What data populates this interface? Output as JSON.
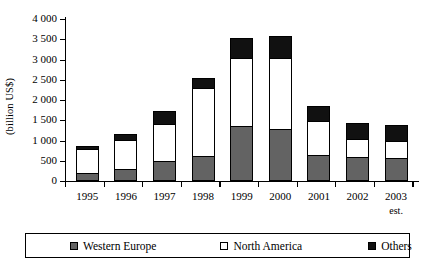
{
  "chart_data": {
    "type": "bar",
    "stacked": true,
    "title": "",
    "xlabel": "",
    "ylabel": "(billion US$)",
    "ylim": [
      0,
      4000
    ],
    "ytick_labels": [
      "4 000",
      "3 500",
      "3 000",
      "2 500",
      "2 000",
      "1 500",
      "1 000",
      "500",
      "0"
    ],
    "ytick_values": [
      4000,
      3500,
      3000,
      2500,
      2000,
      1500,
      1000,
      500,
      0
    ],
    "grid": false,
    "legend_position": "bottom",
    "categories": [
      "1995",
      "1996",
      "1997",
      "1998",
      "1999",
      "2000",
      "2001",
      "2002",
      "2003"
    ],
    "category_notes": [
      "",
      "",
      "",
      "",
      "",
      "",
      "",
      "",
      "est."
    ],
    "series": [
      {
        "name": "Western Europe",
        "color": "#636363",
        "values": [
          180,
          270,
          470,
          600,
          1330,
          1250,
          620,
          560,
          540
        ]
      },
      {
        "name": "North America",
        "color": "#ffffff",
        "values": [
          580,
          720,
          900,
          1660,
          1680,
          1760,
          830,
          440,
          410
        ]
      },
      {
        "name": "Others",
        "color": "#111111",
        "values": [
          80,
          140,
          330,
          250,
          490,
          540,
          370,
          400,
          400
        ]
      }
    ],
    "totals": [
      840,
      1130,
      1700,
      2510,
      3500,
      3550,
      1820,
      1400,
      1350
    ]
  },
  "legend": {
    "items": [
      {
        "label": "Western Europe",
        "swatch": "western-europe-swatch"
      },
      {
        "label": "North America",
        "swatch": "north-america-swatch"
      },
      {
        "label": "Others",
        "swatch": "others-swatch"
      }
    ]
  }
}
